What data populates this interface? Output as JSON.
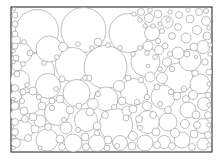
{
  "figure": {
    "kind": "circle-packing-diagram",
    "background_color": "#ffffff",
    "frame_color": "#2a2a2a",
    "circle_stroke_color": "#8a8a8a",
    "circle_fill_color": "#ffffff",
    "frame": {
      "x": 11,
      "y": 7,
      "width": 201,
      "height": 145
    }
  },
  "chart_data": {
    "type": "scatter",
    "subtitle": "",
    "xlabel": "",
    "ylabel": "",
    "grid": false,
    "legend": "none",
    "xlim": [
      11,
      212
    ],
    "ylim": [
      7,
      152
    ],
    "units": "pixels",
    "count": 196,
    "radius_range": [
      1.6,
      22.5
    ],
    "circles": [
      {
        "cx": 37.0,
        "cy": 31.0,
        "r": 21.5
      },
      {
        "cx": 83.5,
        "cy": 30.0,
        "r": 22.5
      },
      {
        "cx": 128.5,
        "cy": 33.0,
        "r": 19.5
      },
      {
        "cx": 36.0,
        "cy": 72.0,
        "r": 18.5
      },
      {
        "cx": 72.5,
        "cy": 64.5,
        "r": 17.0
      },
      {
        "cx": 105.5,
        "cy": 67.0,
        "r": 21.5
      },
      {
        "cx": 145.5,
        "cy": 62.0,
        "r": 14.5
      },
      {
        "cx": 178.0,
        "cy": 78.0,
        "r": 15.0
      },
      {
        "cx": 22.0,
        "cy": 53.0,
        "r": 10.0
      },
      {
        "cx": 49.0,
        "cy": 49.0,
        "r": 13.0
      },
      {
        "cx": 20.0,
        "cy": 80.0,
        "r": 9.5
      },
      {
        "cx": 48.0,
        "cy": 86.0,
        "r": 12.5
      },
      {
        "cx": 76.5,
        "cy": 93.0,
        "r": 13.5
      },
      {
        "cx": 106.0,
        "cy": 99.0,
        "r": 12.0
      },
      {
        "cx": 134.0,
        "cy": 92.0,
        "r": 13.5
      },
      {
        "cx": 163.0,
        "cy": 97.0,
        "r": 12.0
      },
      {
        "cx": 190.0,
        "cy": 60.0,
        "r": 11.0
      },
      {
        "cx": 200.0,
        "cy": 84.0,
        "r": 10.0
      },
      {
        "cx": 30.0,
        "cy": 103.0,
        "r": 11.0
      },
      {
        "cx": 57.0,
        "cy": 113.0,
        "r": 12.5
      },
      {
        "cx": 86.0,
        "cy": 120.0,
        "r": 11.5
      },
      {
        "cx": 116.0,
        "cy": 125.0,
        "r": 16.5
      },
      {
        "cx": 148.0,
        "cy": 122.0,
        "r": 11.5
      },
      {
        "cx": 23.0,
        "cy": 130.0,
        "r": 10.0
      },
      {
        "cx": 47.0,
        "cy": 140.0,
        "r": 11.0
      },
      {
        "cx": 73.0,
        "cy": 143.0,
        "r": 9.0
      },
      {
        "cx": 97.0,
        "cy": 143.0,
        "r": 8.5
      },
      {
        "cx": 145.0,
        "cy": 143.0,
        "r": 8.0
      },
      {
        "cx": 168.0,
        "cy": 122.0,
        "r": 9.0
      },
      {
        "cx": 188.0,
        "cy": 110.0,
        "r": 8.0
      },
      {
        "cx": 152.0,
        "cy": 33.0,
        "r": 7.5
      },
      {
        "cx": 167.0,
        "cy": 22.0,
        "r": 6.0
      },
      {
        "cx": 119.0,
        "cy": 86.0,
        "r": 5.5
      },
      {
        "cx": 16.0,
        "cy": 96.0,
        "r": 5.5
      },
      {
        "cx": 17.0,
        "cy": 115.0,
        "r": 6.5
      },
      {
        "cx": 40.0,
        "cy": 121.0,
        "r": 6.0
      },
      {
        "cx": 66.0,
        "cy": 128.0,
        "r": 6.0
      },
      {
        "cx": 93.0,
        "cy": 104.0,
        "r": 5.5
      },
      {
        "cx": 127.0,
        "cy": 111.0,
        "r": 5.0
      },
      {
        "cx": 162.0,
        "cy": 78.0,
        "r": 5.5
      },
      {
        "cx": 178.0,
        "cy": 53.0,
        "r": 6.0
      },
      {
        "cx": 186.0,
        "cy": 38.0,
        "r": 5.0
      },
      {
        "cx": 203.0,
        "cy": 47.0,
        "r": 6.5
      },
      {
        "cx": 204.0,
        "cy": 104.0,
        "r": 6.5
      },
      {
        "cx": 203.0,
        "cy": 126.0,
        "r": 7.5
      },
      {
        "cx": 182.0,
        "cy": 140.0,
        "r": 8.0
      },
      {
        "cx": 203.0,
        "cy": 144.0,
        "r": 6.0
      },
      {
        "cx": 120.0,
        "cy": 143.0,
        "r": 7.5
      },
      {
        "cx": 164.0,
        "cy": 142.0,
        "r": 6.5
      },
      {
        "cx": 17.0,
        "cy": 66.0,
        "r": 5.0
      },
      {
        "cx": 16.0,
        "cy": 40.0,
        "r": 4.5
      },
      {
        "cx": 63.0,
        "cy": 47.0,
        "r": 4.5
      },
      {
        "cx": 98.0,
        "cy": 42.0,
        "r": 4.0
      },
      {
        "cx": 148.0,
        "cy": 46.0,
        "r": 5.0
      },
      {
        "cx": 159.0,
        "cy": 50.0,
        "r": 4.5
      },
      {
        "cx": 167.0,
        "cy": 62.0,
        "r": 4.5
      },
      {
        "cx": 150.0,
        "cy": 77.0,
        "r": 5.0
      },
      {
        "cx": 193.0,
        "cy": 95.0,
        "r": 4.5
      },
      {
        "cx": 185.0,
        "cy": 124.0,
        "r": 4.5
      },
      {
        "cx": 175.0,
        "cy": 133.0,
        "r": 4.5
      },
      {
        "cx": 133.0,
        "cy": 136.0,
        "r": 4.5
      },
      {
        "cx": 133.0,
        "cy": 109.0,
        "r": 4.0
      },
      {
        "cx": 97.0,
        "cy": 126.0,
        "r": 4.0
      },
      {
        "cx": 70.0,
        "cy": 110.0,
        "r": 4.0
      },
      {
        "cx": 42.0,
        "cy": 106.0,
        "r": 4.0
      },
      {
        "cx": 33.0,
        "cy": 117.0,
        "r": 4.0
      },
      {
        "cx": 24.0,
        "cy": 111.0,
        "r": 4.0
      },
      {
        "cx": 15.0,
        "cy": 106.0,
        "r": 4.0
      },
      {
        "cx": 16.0,
        "cy": 143.0,
        "r": 4.5
      },
      {
        "cx": 35.0,
        "cy": 129.0,
        "r": 4.0
      },
      {
        "cx": 60.0,
        "cy": 139.0,
        "r": 4.0
      },
      {
        "cx": 85.0,
        "cy": 137.0,
        "r": 4.0
      },
      {
        "cx": 108.0,
        "cy": 140.0,
        "r": 4.0
      },
      {
        "cx": 132.0,
        "cy": 146.0,
        "r": 4.0
      },
      {
        "cx": 156.0,
        "cy": 132.0,
        "r": 4.0
      },
      {
        "cx": 194.0,
        "cy": 134.0,
        "r": 4.0
      },
      {
        "cx": 196.0,
        "cy": 115.0,
        "r": 4.0
      },
      {
        "cx": 177.0,
        "cy": 96.0,
        "r": 4.0
      },
      {
        "cx": 147.0,
        "cy": 106.0,
        "r": 4.5
      },
      {
        "cx": 122.0,
        "cy": 101.0,
        "r": 4.0
      },
      {
        "cx": 90.0,
        "cy": 112.0,
        "r": 4.0
      },
      {
        "cx": 60.0,
        "cy": 99.0,
        "r": 4.0
      },
      {
        "cx": 33.0,
        "cy": 91.0,
        "r": 4.0
      },
      {
        "cx": 15.0,
        "cy": 88.0,
        "r": 3.5
      },
      {
        "cx": 15.0,
        "cy": 122.0,
        "r": 3.5
      },
      {
        "cx": 15.0,
        "cy": 132.0,
        "r": 3.5
      },
      {
        "cx": 25.0,
        "cy": 119.0,
        "r": 3.5
      },
      {
        "cx": 28.0,
        "cy": 138.0,
        "r": 3.5
      },
      {
        "cx": 48.0,
        "cy": 127.0,
        "r": 3.5
      },
      {
        "cx": 62.0,
        "cy": 147.0,
        "r": 3.5
      },
      {
        "cx": 86.0,
        "cy": 147.0,
        "r": 3.5
      },
      {
        "cx": 107.0,
        "cy": 148.0,
        "r": 3.0
      },
      {
        "cx": 157.0,
        "cy": 145.0,
        "r": 3.5
      },
      {
        "cx": 172.0,
        "cy": 146.0,
        "r": 3.5
      },
      {
        "cx": 192.0,
        "cy": 147.0,
        "r": 3.5
      },
      {
        "cx": 208.0,
        "cy": 135.0,
        "r": 3.5
      },
      {
        "cx": 208.0,
        "cy": 115.0,
        "r": 3.5
      },
      {
        "cx": 197.0,
        "cy": 125.0,
        "r": 3.5
      },
      {
        "cx": 186.0,
        "cy": 99.0,
        "r": 3.5
      },
      {
        "cx": 168.0,
        "cy": 110.0,
        "r": 3.5
      },
      {
        "cx": 153.0,
        "cy": 115.0,
        "r": 3.5
      },
      {
        "cx": 139.0,
        "cy": 119.0,
        "r": 3.5
      },
      {
        "cx": 126.0,
        "cy": 118.0,
        "r": 3.0
      },
      {
        "cx": 105.0,
        "cy": 115.0,
        "r": 3.5
      },
      {
        "cx": 79.0,
        "cy": 106.0,
        "r": 3.0
      },
      {
        "cx": 52.0,
        "cy": 101.0,
        "r": 3.0
      },
      {
        "cx": 23.0,
        "cy": 92.0,
        "r": 3.0
      },
      {
        "cx": 17.0,
        "cy": 74.0,
        "r": 3.0
      },
      {
        "cx": 16.0,
        "cy": 58.0,
        "r": 3.0
      },
      {
        "cx": 15.0,
        "cy": 46.0,
        "r": 3.0
      },
      {
        "cx": 15.0,
        "cy": 34.0,
        "r": 3.0
      },
      {
        "cx": 15.0,
        "cy": 24.0,
        "r": 3.0
      },
      {
        "cx": 15.0,
        "cy": 15.0,
        "r": 3.0
      },
      {
        "cx": 30.0,
        "cy": 53.0,
        "r": 3.0
      },
      {
        "cx": 62.0,
        "cy": 79.0,
        "r": 3.0
      },
      {
        "cx": 89.0,
        "cy": 78.0,
        "r": 3.0
      },
      {
        "cx": 128.0,
        "cy": 78.0,
        "r": 3.0
      },
      {
        "cx": 141.0,
        "cy": 80.0,
        "r": 2.8
      },
      {
        "cx": 157.0,
        "cy": 87.0,
        "r": 3.0
      },
      {
        "cx": 171.0,
        "cy": 92.0,
        "r": 2.8
      },
      {
        "cx": 208.0,
        "cy": 95.0,
        "r": 3.0
      },
      {
        "cx": 209.0,
        "cy": 72.0,
        "r": 3.0
      },
      {
        "cx": 205.0,
        "cy": 62.0,
        "r": 3.2
      },
      {
        "cx": 195.0,
        "cy": 73.0,
        "r": 3.2
      },
      {
        "cx": 184.0,
        "cy": 89.0,
        "r": 2.8
      },
      {
        "cx": 165.0,
        "cy": 46.0,
        "r": 3.0
      },
      {
        "cx": 172.0,
        "cy": 36.0,
        "r": 3.5
      },
      {
        "cx": 178.0,
        "cy": 27.0,
        "r": 3.5
      },
      {
        "cx": 179.0,
        "cy": 15.0,
        "r": 3.5
      },
      {
        "cx": 190.0,
        "cy": 19.0,
        "r": 4.0
      },
      {
        "cx": 199.0,
        "cy": 12.0,
        "r": 3.5
      },
      {
        "cx": 206.0,
        "cy": 21.0,
        "r": 4.5
      },
      {
        "cx": 197.0,
        "cy": 30.0,
        "r": 4.5
      },
      {
        "cx": 207.0,
        "cy": 36.0,
        "r": 4.0
      },
      {
        "cx": 194.0,
        "cy": 47.0,
        "r": 4.0
      },
      {
        "cx": 187.0,
        "cy": 54.0,
        "r": 3.0
      },
      {
        "cx": 158.0,
        "cy": 14.0,
        "r": 4.0
      },
      {
        "cx": 149.0,
        "cy": 18.0,
        "r": 4.5
      },
      {
        "cx": 141.0,
        "cy": 12.0,
        "r": 3.5
      },
      {
        "cx": 150.0,
        "cy": 10.0,
        "r": 2.4
      },
      {
        "cx": 162.0,
        "cy": 31.0,
        "r": 2.6
      },
      {
        "cx": 158.0,
        "cy": 41.0,
        "r": 2.6
      },
      {
        "cx": 170.0,
        "cy": 54.0,
        "r": 2.6
      },
      {
        "cx": 172.0,
        "cy": 69.0,
        "r": 2.6
      },
      {
        "cx": 160.0,
        "cy": 69.0,
        "r": 2.4
      },
      {
        "cx": 155.0,
        "cy": 57.0,
        "r": 2.4
      },
      {
        "cx": 147.0,
        "cy": 53.0,
        "r": 2.4
      },
      {
        "cx": 140.0,
        "cy": 48.0,
        "r": 2.4
      },
      {
        "cx": 133.0,
        "cy": 54.0,
        "r": 2.4
      },
      {
        "cx": 120.0,
        "cy": 48.0,
        "r": 2.4
      },
      {
        "cx": 108.0,
        "cy": 45.0,
        "r": 2.4
      },
      {
        "cx": 92.0,
        "cy": 48.0,
        "r": 2.4
      },
      {
        "cx": 78.0,
        "cy": 44.0,
        "r": 2.4
      },
      {
        "cx": 57.0,
        "cy": 57.0,
        "r": 2.4
      },
      {
        "cx": 44.0,
        "cy": 63.0,
        "r": 2.4
      },
      {
        "cx": 23.0,
        "cy": 64.0,
        "r": 2.4
      },
      {
        "cx": 24.0,
        "cy": 42.0,
        "r": 2.4
      },
      {
        "cx": 22.0,
        "cy": 101.0,
        "r": 2.6
      },
      {
        "cx": 39.0,
        "cy": 97.0,
        "r": 2.6
      },
      {
        "cx": 52.0,
        "cy": 108.0,
        "r": 2.6
      },
      {
        "cx": 64.0,
        "cy": 120.0,
        "r": 2.6
      },
      {
        "cx": 78.0,
        "cy": 130.0,
        "r": 2.6
      },
      {
        "cx": 97.0,
        "cy": 133.0,
        "r": 2.6
      },
      {
        "cx": 117.0,
        "cy": 146.0,
        "r": 2.6
      },
      {
        "cx": 140.0,
        "cy": 128.0,
        "r": 2.6
      },
      {
        "cx": 160.0,
        "cy": 104.0,
        "r": 2.6
      },
      {
        "cx": 147.0,
        "cy": 97.0,
        "r": 2.6
      },
      {
        "cx": 137.0,
        "cy": 102.0,
        "r": 2.6
      },
      {
        "cx": 114.0,
        "cy": 107.0,
        "r": 2.6
      },
      {
        "cx": 98.0,
        "cy": 94.0,
        "r": 2.6
      },
      {
        "cx": 85.0,
        "cy": 78.0,
        "r": 2.4
      },
      {
        "cx": 56.0,
        "cy": 89.0,
        "r": 2.4
      },
      {
        "cx": 27.0,
        "cy": 85.0,
        "r": 2.4
      },
      {
        "cx": 168.0,
        "cy": 20.0,
        "r": 2.2
      },
      {
        "cx": 160.0,
        "cy": 24.0,
        "r": 2.2
      },
      {
        "cx": 153.0,
        "cy": 26.0,
        "r": 2.2
      },
      {
        "cx": 145.0,
        "cy": 26.0,
        "r": 2.2
      },
      {
        "cx": 140.0,
        "cy": 20.0,
        "r": 2.2
      },
      {
        "cx": 134.0,
        "cy": 14.0,
        "r": 2.2
      },
      {
        "cx": 170.0,
        "cy": 12.0,
        "r": 2.2
      },
      {
        "cx": 188.0,
        "cy": 10.0,
        "r": 2.2
      },
      {
        "cx": 206.0,
        "cy": 11.0,
        "r": 2.6
      },
      {
        "cx": 209.0,
        "cy": 28.0,
        "r": 2.2
      },
      {
        "cx": 210.0,
        "cy": 45.0,
        "r": 2.2
      },
      {
        "cx": 210.0,
        "cy": 54.0,
        "r": 2.2
      },
      {
        "cx": 209.0,
        "cy": 84.0,
        "r": 2.2
      },
      {
        "cx": 209.0,
        "cy": 105.0,
        "r": 2.2
      },
      {
        "cx": 209.0,
        "cy": 125.0,
        "r": 2.2
      },
      {
        "cx": 209.0,
        "cy": 145.0,
        "r": 2.2
      },
      {
        "cx": 14.0,
        "cy": 9.0,
        "r": 1.8
      },
      {
        "cx": 13.5,
        "cy": 51.0,
        "r": 1.8
      },
      {
        "cx": 13.5,
        "cy": 62.0,
        "r": 1.8
      },
      {
        "cx": 13.5,
        "cy": 99.0,
        "r": 1.8
      },
      {
        "cx": 13.5,
        "cy": 137.0,
        "r": 1.8
      },
      {
        "cx": 13.5,
        "cy": 148.0,
        "r": 1.8
      },
      {
        "cx": 40.0,
        "cy": 148.0,
        "r": 2.0
      },
      {
        "cx": 148.0,
        "cy": 66.0,
        "r": 1.8
      },
      {
        "cx": 196.0,
        "cy": 57.0,
        "r": 1.8
      }
    ]
  }
}
